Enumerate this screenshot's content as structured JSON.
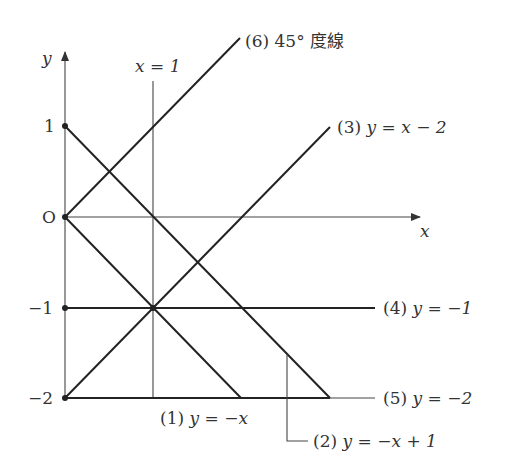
{
  "colors": {
    "line": "#222222",
    "axis": "#444444",
    "text": "#333333",
    "background": "#ffffff"
  },
  "axes": {
    "x_label": "x",
    "y_label": "y",
    "origin_label": "O",
    "y_ticks": [
      "1",
      "−1",
      "−2"
    ]
  },
  "vertical_line": {
    "label": "x = 1"
  },
  "lines": [
    {
      "id": "1",
      "number": "(1)",
      "equation": "y = −x"
    },
    {
      "id": "2",
      "number": "(2)",
      "equation": "y = −x + 1"
    },
    {
      "id": "3",
      "number": "(3)",
      "equation": "y = x − 2"
    },
    {
      "id": "4",
      "number": "(4)",
      "equation": "y = −1"
    },
    {
      "id": "5",
      "number": "(5)",
      "equation": "y = −2"
    },
    {
      "id": "6",
      "number": "(6)",
      "equation": "45° 度線"
    }
  ]
}
